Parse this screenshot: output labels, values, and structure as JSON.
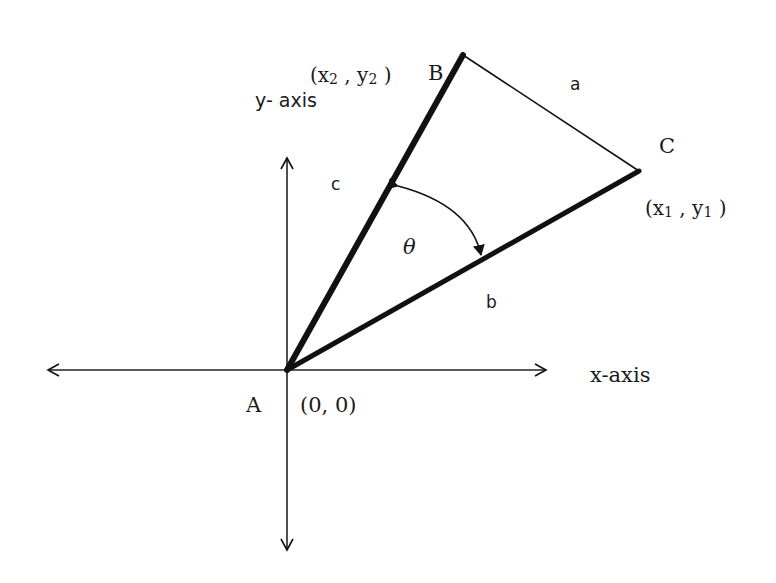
{
  "diagram": {
    "axes": {
      "x_label": "x-axis",
      "y_label": "y- axis",
      "origin_label": "(0, 0)"
    },
    "vertices": {
      "A": {
        "name": "A",
        "coord": "(0, 0)"
      },
      "B": {
        "name": "B",
        "coord_prefix": "(x",
        "sub1": "2",
        "mid": " , y",
        "sub2": "2",
        "coord_suffix": " )"
      },
      "C": {
        "name": "C",
        "coord_prefix": "(x",
        "sub1": "1",
        "mid": " , y",
        "sub2": "1",
        "coord_suffix": " )"
      }
    },
    "sides": {
      "a": "a",
      "b": "b",
      "c": "c"
    },
    "angle": {
      "symbol": "θ"
    },
    "colors": {
      "stroke": "#111111",
      "background": "#ffffff"
    }
  }
}
